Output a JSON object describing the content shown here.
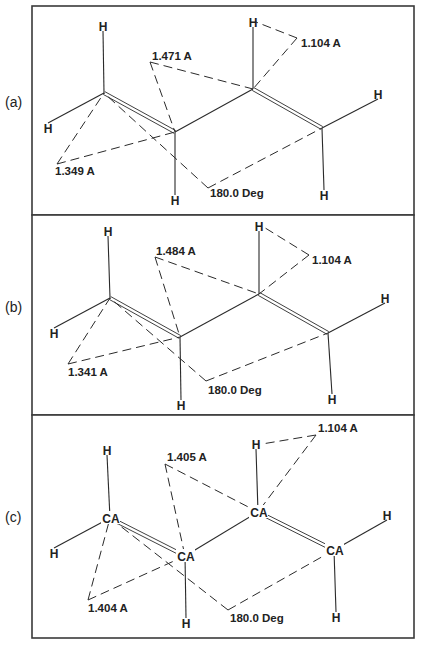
{
  "figure": {
    "panels": [
      {
        "id": "a",
        "label": "(a)",
        "frame": {
          "x": 32,
          "y": 6,
          "w": 382,
          "h": 209
        },
        "label_pos": {
          "x": 5,
          "y": 107
        },
        "carbon_label": "",
        "carbons": [
          [
            104,
            93
          ],
          [
            175,
            132
          ],
          [
            253,
            89
          ],
          [
            322,
            128
          ]
        ],
        "hydrogens": [
          {
            "text": "H",
            "x": 103,
            "y": 26,
            "bond_to": 0
          },
          {
            "text": "H",
            "x": 48,
            "y": 128,
            "bond_to": 0
          },
          {
            "text": "H",
            "x": 175,
            "y": 200,
            "bond_to": 1
          },
          {
            "text": "H",
            "x": 253,
            "y": 22,
            "bond_to": 2
          },
          {
            "text": "H",
            "x": 378,
            "y": 94,
            "bond_to": 3
          },
          {
            "text": "H",
            "x": 324,
            "y": 195,
            "bond_to": 3
          }
        ],
        "measurements": [
          {
            "text": "1.349 A",
            "label": {
              "x": 55,
              "y": 175
            },
            "vertex": [
              57,
              164
            ],
            "ends": [
              [
                104,
                93
              ],
              [
                175,
                132
              ]
            ]
          },
          {
            "text": "1.471 A",
            "label": {
              "x": 152,
              "y": 60
            },
            "vertex": [
              150,
              62
            ],
            "ends": [
              [
                175,
                132
              ],
              [
                253,
                89
              ]
            ]
          },
          {
            "text": "1.104 A",
            "label": {
              "x": 301,
              "y": 47
            },
            "vertex": [
              297,
              38
            ],
            "ends": [
              [
                256,
                22
              ],
              [
                253,
                89
              ]
            ]
          },
          {
            "text": "180.0 Deg",
            "label": {
              "x": 210,
              "y": 197
            },
            "vertex": [
              208,
              188
            ],
            "ends": [
              [
                104,
                93
              ],
              [
                322,
                128
              ]
            ]
          }
        ]
      },
      {
        "id": "b",
        "label": "(b)",
        "frame": {
          "x": 32,
          "y": 215,
          "w": 382,
          "h": 200
        },
        "label_pos": {
          "x": 5,
          "y": 312
        },
        "carbon_label": "",
        "carbons": [
          [
            110,
            298
          ],
          [
            180,
            337
          ],
          [
            259,
            294
          ],
          [
            328,
            333
          ]
        ],
        "hydrogens": [
          {
            "text": "H",
            "x": 108,
            "y": 231,
            "bond_to": 0
          },
          {
            "text": "H",
            "x": 54,
            "y": 333,
            "bond_to": 0
          },
          {
            "text": "H",
            "x": 181,
            "y": 405,
            "bond_to": 1
          },
          {
            "text": "H",
            "x": 259,
            "y": 226,
            "bond_to": 2
          },
          {
            "text": "H",
            "x": 385,
            "y": 298,
            "bond_to": 3
          },
          {
            "text": "H",
            "x": 332,
            "y": 399,
            "bond_to": 3
          }
        ],
        "measurements": [
          {
            "text": "1.341 A",
            "label": {
              "x": 68,
              "y": 376
            },
            "vertex": [
              68,
              364
            ],
            "ends": [
              [
                110,
                298
              ],
              [
                180,
                337
              ]
            ]
          },
          {
            "text": "1.484 A",
            "label": {
              "x": 156,
              "y": 255
            },
            "vertex": [
              155,
              257
            ],
            "ends": [
              [
                180,
                337
              ],
              [
                259,
                294
              ]
            ]
          },
          {
            "text": "1.104 A",
            "label": {
              "x": 312,
              "y": 264
            },
            "vertex": [
              309,
              255
            ],
            "ends": [
              [
                262,
                226
              ],
              [
                259,
                294
              ]
            ]
          },
          {
            "text": "180.0 Deg",
            "label": {
              "x": 208,
              "y": 394
            },
            "vertex": [
              206,
              381
            ],
            "ends": [
              [
                110,
                298
              ],
              [
                328,
                333
              ]
            ]
          }
        ]
      },
      {
        "id": "c",
        "label": "(c)",
        "frame": {
          "x": 32,
          "y": 415,
          "w": 382,
          "h": 223
        },
        "label_pos": {
          "x": 5,
          "y": 522
        },
        "carbon_label": "CA",
        "carbons": [
          [
            110,
            518
          ],
          [
            185,
            556
          ],
          [
            258,
            512
          ],
          [
            334,
            550
          ]
        ],
        "hydrogens": [
          {
            "text": "H",
            "x": 107,
            "y": 450,
            "bond_to": 0
          },
          {
            "text": "H",
            "x": 54,
            "y": 553,
            "bond_to": 0
          },
          {
            "text": "H",
            "x": 186,
            "y": 623,
            "bond_to": 1
          },
          {
            "text": "H",
            "x": 256,
            "y": 444,
            "bond_to": 2
          },
          {
            "text": "H",
            "x": 387,
            "y": 515,
            "bond_to": 3
          },
          {
            "text": "H",
            "x": 336,
            "y": 617,
            "bond_to": 3
          }
        ],
        "measurements": [
          {
            "text": "1.404 A",
            "label": {
              "x": 88,
              "y": 612
            },
            "vertex": [
              88,
              600
            ],
            "ends": [
              [
                110,
                518
              ],
              [
                185,
                556
              ]
            ]
          },
          {
            "text": "1.405 A",
            "label": {
              "x": 167,
              "y": 461
            },
            "vertex": [
              165,
              464
            ],
            "ends": [
              [
                185,
                556
              ],
              [
                258,
                512
              ]
            ]
          },
          {
            "text": "1.104 A",
            "label": {
              "x": 318,
              "y": 432
            },
            "vertex": [
              316,
              435
            ],
            "ends": [
              [
                262,
                444
              ],
              [
                258,
                512
              ]
            ]
          },
          {
            "text": "180.0 Deg",
            "label": {
              "x": 230,
              "y": 622
            },
            "vertex": [
              228,
              610
            ],
            "ends": [
              [
                110,
                518
              ],
              [
                334,
                550
              ]
            ]
          }
        ]
      }
    ]
  }
}
